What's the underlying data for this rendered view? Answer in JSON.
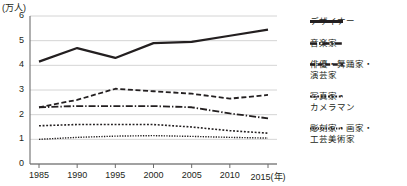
{
  "chart_data": {
    "type": "line",
    "title": "",
    "xlabel": "(年)",
    "ylabel": "(万人)",
    "unit_label": "(万人)",
    "x": [
      1985,
      1990,
      1995,
      2000,
      2005,
      2010,
      2015
    ],
    "xtick_labels": [
      "1985",
      "1990",
      "1995",
      "2000",
      "2005",
      "2010",
      "2015(年)"
    ],
    "ytick_labels": [
      "0",
      "1",
      "2",
      "3",
      "4",
      "5",
      "6"
    ],
    "yticks": [
      0,
      1,
      2,
      3,
      4,
      5,
      6
    ],
    "ylim": [
      0,
      6
    ],
    "xlim": [
      1983,
      2016
    ],
    "grid": true,
    "legend_position": "right",
    "series": [
      {
        "name": "デザイナー",
        "legend_label": "デザイナー",
        "style": "solid",
        "color": "#231f20",
        "width": 2.2,
        "values": [
          4.15,
          4.7,
          4.3,
          4.9,
          4.95,
          5.2,
          5.45
        ]
      },
      {
        "name": "音楽家",
        "legend_label": "音楽家",
        "style": "dash-dot",
        "color": "#231f20",
        "width": 1.8,
        "values": [
          2.3,
          2.35,
          2.35,
          2.35,
          2.3,
          2.05,
          1.85
        ]
      },
      {
        "name": "俳優・舞踊家・演芸家",
        "legend_label": "俳優・舞踊家・\n演芸家",
        "style": "dashed",
        "color": "#231f20",
        "width": 1.8,
        "values": [
          2.3,
          2.6,
          3.05,
          2.95,
          2.85,
          2.65,
          2.8
        ]
      },
      {
        "name": "写真家・カメラマン",
        "legend_label": "写真家・\nカメラマン",
        "style": "dotted",
        "color": "#231f20",
        "width": 1.6,
        "values": [
          1.55,
          1.6,
          1.6,
          1.6,
          1.5,
          1.35,
          1.25
        ]
      },
      {
        "name": "彫刻家・画家・工芸美術家",
        "legend_label": "彫刻家・画家・\n工芸美術家",
        "style": "fine-dotted",
        "color": "#231f20",
        "width": 1.4,
        "values": [
          1.0,
          1.08,
          1.13,
          1.15,
          1.12,
          1.08,
          1.05
        ]
      }
    ]
  }
}
